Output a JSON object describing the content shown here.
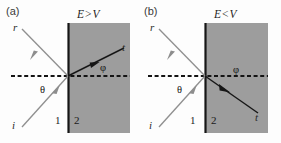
{
  "figure": {
    "width": 281,
    "height": 143,
    "background": "#fdfdfd",
    "colors": {
      "incident_ray": "#8f8f8f",
      "reflected_ray": "#8f8f8f",
      "transmitted_ray": "#1a1a1a",
      "normal_dashed": "#1a1a1a",
      "interface_line": "#161616",
      "region2_fill": "#9d9d9d",
      "text": "#1f1f1f"
    }
  },
  "panels": [
    {
      "tag": "(a)",
      "condition": {
        "energy": "E",
        "operator": ">",
        "potential": "V",
        "full": "E > V"
      },
      "regions": [
        {
          "label": "1",
          "name": "region-one"
        },
        {
          "label": "2",
          "name": "region-two"
        }
      ],
      "rays": [
        {
          "label": "r",
          "name": "reflected-ray",
          "direction": "up-left"
        },
        {
          "label": "i",
          "name": "incident-ray",
          "direction": "up-right"
        },
        {
          "label": "t",
          "name": "transmitted-ray",
          "direction": "up-right"
        }
      ],
      "angles": [
        {
          "label": "θ",
          "name": "theta-angle"
        },
        {
          "label": "φ",
          "name": "phi-angle"
        }
      ]
    },
    {
      "tag": "(b)",
      "condition": {
        "energy": "E",
        "operator": "<",
        "potential": "V",
        "full": "E < V"
      },
      "regions": [
        {
          "label": "1",
          "name": "region-one"
        },
        {
          "label": "2",
          "name": "region-two"
        }
      ],
      "rays": [
        {
          "label": "r",
          "name": "reflected-ray",
          "direction": "up-left"
        },
        {
          "label": "i",
          "name": "incident-ray",
          "direction": "up-right"
        },
        {
          "label": "t",
          "name": "transmitted-ray",
          "direction": "down-right"
        }
      ],
      "angles": [
        {
          "label": "θ",
          "name": "theta-angle"
        },
        {
          "label": "φ",
          "name": "phi-angle"
        }
      ]
    }
  ]
}
